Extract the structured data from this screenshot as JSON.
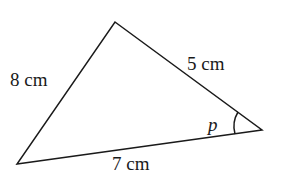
{
  "diagram": {
    "type": "triangle",
    "vertices": {
      "top": [
        115,
        22
      ],
      "right": [
        262,
        130
      ],
      "bottom_left": [
        17,
        164
      ]
    },
    "sides": [
      {
        "id": "left",
        "label": "8 cm"
      },
      {
        "id": "right",
        "label": "5 cm"
      },
      {
        "id": "bottom",
        "label": "7 cm"
      }
    ],
    "angle": {
      "vertex": "right",
      "label": "p"
    },
    "colors": {
      "stroke": "#1a1a1a",
      "background": "#ffffff"
    }
  }
}
